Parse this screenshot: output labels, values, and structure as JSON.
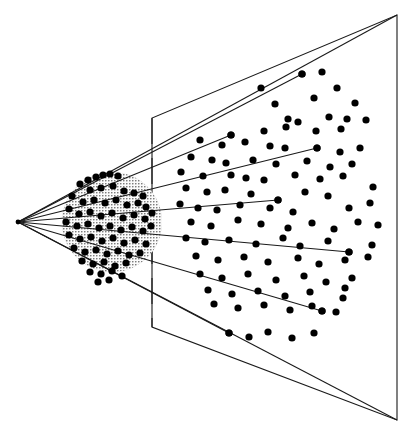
{
  "figure": {
    "title": "Perspective projection of a point cluster onto an image plane",
    "type": "geometric-diagram",
    "width": 413,
    "height": 431,
    "background_color": "#ffffff",
    "stroke_color": "#1a1a1a",
    "dot_color": "#000000",
    "blob_fill_color": "#c8c8c8",
    "blob_stipple_color": "#5a5a5a",
    "dot_radius": 3.6,
    "line_width": 1.1
  },
  "viewpoint": {
    "label": "apex",
    "x": 18,
    "y": 222
  },
  "image_plane": {
    "label": "projection-plane",
    "corners": [
      {
        "x": 397,
        "y": 15
      },
      {
        "x": 397,
        "y": 420
      },
      {
        "x": 152,
        "y": 327
      },
      {
        "x": 152,
        "y": 118
      }
    ],
    "near_edge_x": 152,
    "near_edge_top_y": 118,
    "near_edge_bottom_y": 327,
    "far_edge_x": 397,
    "far_edge_top_y": 15,
    "far_edge_bottom_y": 420
  },
  "frustum_edges": [
    {
      "name": "frustum-edge-top",
      "x1": 18,
      "y1": 222,
      "x2": 397,
      "y2": 15
    },
    {
      "name": "frustum-edge-bottom",
      "x1": 18,
      "y1": 222,
      "x2": 397,
      "y2": 420
    }
  ],
  "projection_rays": [
    {
      "name": "ray-1",
      "x1": 18,
      "y1": 222,
      "x2": 302,
      "y2": 74
    },
    {
      "name": "ray-2",
      "x1": 18,
      "y1": 222,
      "x2": 231,
      "y2": 135
    },
    {
      "name": "ray-3",
      "x1": 18,
      "y1": 222,
      "x2": 317,
      "y2": 148
    },
    {
      "name": "ray-4",
      "x1": 18,
      "y1": 222,
      "x2": 278,
      "y2": 200
    },
    {
      "name": "ray-5",
      "x1": 18,
      "y1": 222,
      "x2": 349,
      "y2": 252
    },
    {
      "name": "ray-6",
      "x1": 18,
      "y1": 222,
      "x2": 322,
      "y2": 311
    },
    {
      "name": "ray-7",
      "x1": 18,
      "y1": 222,
      "x2": 229,
      "y2": 333
    }
  ],
  "blob": {
    "label": "stippled-point-cluster",
    "center_x": 112,
    "center_y": 222,
    "radius_x": 50,
    "radius_y": 50
  },
  "chart_data": {
    "type": "scatter",
    "title": "Perspective projection of a point cluster onto an image plane",
    "xlabel": "",
    "ylabel": "",
    "xlim": [
      0,
      413
    ],
    "ylim": [
      0,
      431
    ],
    "grid": false,
    "legend": "none",
    "series": [
      {
        "name": "cluster-points",
        "note": "dense dots inside the stippled blob near the viewpoint",
        "points": [
          [
            88,
            180
          ],
          [
            96,
            177
          ],
          [
            103,
            175
          ],
          [
            110,
            174
          ],
          [
            118,
            176
          ],
          [
            80,
            184
          ],
          [
            90,
            190
          ],
          [
            101,
            188
          ],
          [
            113,
            186
          ],
          [
            124,
            191
          ],
          [
            134,
            193
          ],
          [
            143,
            196
          ],
          [
            72,
            196
          ],
          [
            83,
            202
          ],
          [
            94,
            200
          ],
          [
            105,
            203
          ],
          [
            116,
            200
          ],
          [
            127,
            205
          ],
          [
            138,
            203
          ],
          [
            146,
            207
          ],
          [
            69,
            209
          ],
          [
            79,
            214
          ],
          [
            90,
            212
          ],
          [
            101,
            216
          ],
          [
            112,
            213
          ],
          [
            123,
            218
          ],
          [
            134,
            215
          ],
          [
            145,
            219
          ],
          [
            152,
            213
          ],
          [
            66,
            222
          ],
          [
            77,
            226
          ],
          [
            88,
            224
          ],
          [
            99,
            228
          ],
          [
            110,
            226
          ],
          [
            121,
            230
          ],
          [
            132,
            227
          ],
          [
            143,
            231
          ],
          [
            151,
            226
          ],
          [
            69,
            235
          ],
          [
            80,
            239
          ],
          [
            91,
            237
          ],
          [
            102,
            241
          ],
          [
            113,
            238
          ],
          [
            124,
            243
          ],
          [
            135,
            240
          ],
          [
            146,
            244
          ],
          [
            74,
            248
          ],
          [
            85,
            252
          ],
          [
            96,
            250
          ],
          [
            107,
            254
          ],
          [
            118,
            251
          ],
          [
            129,
            255
          ],
          [
            140,
            253
          ],
          [
            82,
            261
          ],
          [
            93,
            264
          ],
          [
            104,
            262
          ],
          [
            115,
            266
          ],
          [
            126,
            263
          ],
          [
            90,
            272
          ],
          [
            101,
            274
          ],
          [
            112,
            271
          ],
          [
            122,
            276
          ],
          [
            98,
            282
          ],
          [
            109,
            280
          ]
        ]
      },
      {
        "name": "plane-points",
        "note": "sparse dots scattered across the projection plane",
        "points": [
          [
            302,
            74
          ],
          [
            322,
            72
          ],
          [
            261,
            88
          ],
          [
            337,
            88
          ],
          [
            275,
            104
          ],
          [
            314,
            98
          ],
          [
            355,
            103
          ],
          [
            288,
            119
          ],
          [
            298,
            122
          ],
          [
            329,
            117
          ],
          [
            347,
            119
          ],
          [
            366,
            120
          ],
          [
            231,
            135
          ],
          [
            264,
            131
          ],
          [
            286,
            127
          ],
          [
            316,
            131
          ],
          [
            341,
            129
          ],
          [
            200,
            140
          ],
          [
            222,
            145
          ],
          [
            245,
            142
          ],
          [
            270,
            146
          ],
          [
            285,
            148
          ],
          [
            317,
            148
          ],
          [
            340,
            152
          ],
          [
            360,
            148
          ],
          [
            191,
            157
          ],
          [
            212,
            160
          ],
          [
            226,
            163
          ],
          [
            253,
            160
          ],
          [
            276,
            164
          ],
          [
            307,
            161
          ],
          [
            330,
            167
          ],
          [
            352,
            164
          ],
          [
            181,
            172
          ],
          [
            203,
            176
          ],
          [
            231,
            175
          ],
          [
            246,
            178
          ],
          [
            264,
            180
          ],
          [
            295,
            175
          ],
          [
            320,
            179
          ],
          [
            343,
            176
          ],
          [
            186,
            188
          ],
          [
            207,
            192
          ],
          [
            225,
            190
          ],
          [
            251,
            194
          ],
          [
            278,
            200
          ],
          [
            305,
            192
          ],
          [
            328,
            196
          ],
          [
            373,
            187
          ],
          [
            180,
            204
          ],
          [
            198,
            208
          ],
          [
            217,
            210
          ],
          [
            240,
            205
          ],
          [
            270,
            208
          ],
          [
            293,
            212
          ],
          [
            349,
            208
          ],
          [
            370,
            203
          ],
          [
            191,
            222
          ],
          [
            211,
            226
          ],
          [
            238,
            220
          ],
          [
            261,
            224
          ],
          [
            288,
            228
          ],
          [
            312,
            223
          ],
          [
            334,
            229
          ],
          [
            358,
            222
          ],
          [
            378,
            225
          ],
          [
            186,
            238
          ],
          [
            205,
            242
          ],
          [
            229,
            240
          ],
          [
            256,
            244
          ],
          [
            283,
            238
          ],
          [
            300,
            246
          ],
          [
            328,
            241
          ],
          [
            349,
            252
          ],
          [
            372,
            245
          ],
          [
            196,
            256
          ],
          [
            218,
            260
          ],
          [
            244,
            257
          ],
          [
            268,
            262
          ],
          [
            298,
            258
          ],
          [
            319,
            264
          ],
          [
            345,
            260
          ],
          [
            368,
            257
          ],
          [
            200,
            274
          ],
          [
            222,
            278
          ],
          [
            248,
            274
          ],
          [
            276,
            280
          ],
          [
            304,
            276
          ],
          [
            326,
            282
          ],
          [
            352,
            278
          ],
          [
            345,
            288
          ],
          [
            208,
            290
          ],
          [
            232,
            294
          ],
          [
            258,
            291
          ],
          [
            285,
            296
          ],
          [
            310,
            292
          ],
          [
            322,
            311
          ],
          [
            343,
            298
          ],
          [
            214,
            304
          ],
          [
            238,
            308
          ],
          [
            264,
            305
          ],
          [
            290,
            310
          ],
          [
            312,
            306
          ],
          [
            336,
            312
          ],
          [
            229,
            333
          ],
          [
            249,
            337
          ],
          [
            268,
            332
          ],
          [
            292,
            338
          ],
          [
            314,
            333
          ]
        ]
      }
    ]
  }
}
